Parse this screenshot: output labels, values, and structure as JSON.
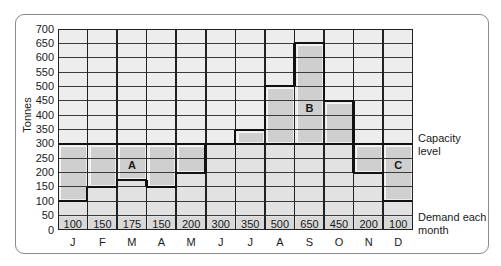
{
  "chart_data": {
    "type": "bar",
    "title": "",
    "xlabel": "",
    "ylabel": "Tonnes",
    "ylim": [
      0,
      700
    ],
    "ytick_step": 50,
    "yticks": [
      0,
      50,
      100,
      150,
      200,
      250,
      300,
      350,
      400,
      450,
      500,
      550,
      600,
      650,
      700
    ],
    "categories": [
      "J",
      "F",
      "M",
      "A",
      "M",
      "J",
      "J",
      "A",
      "S",
      "O",
      "N",
      "D"
    ],
    "series": [
      {
        "name": "Demand each month",
        "values": [
          100,
          150,
          175,
          150,
          200,
          300,
          350,
          500,
          650,
          450,
          200,
          100
        ]
      }
    ],
    "capacity_level": 300,
    "value_labels": [
      "100",
      "150",
      "175",
      "150",
      "200",
      "300",
      "350",
      "500",
      "650",
      "450",
      "200",
      "100"
    ],
    "annotations": [
      {
        "text": "A",
        "column": 2,
        "value": 225
      },
      {
        "text": "B",
        "column": 8,
        "value": 425
      },
      {
        "text": "C",
        "column": 11,
        "value": 225
      }
    ],
    "legend": {
      "capacity": "Capacity level",
      "demand": "Demand each month"
    },
    "grid": true
  },
  "labels": {
    "ylabel": "Tonnes",
    "capacity_line1": "Capacity",
    "capacity_line2": "level",
    "demand_line1": "Demand each",
    "demand_line2": "month"
  },
  "colors": {
    "cell_light": "#ededed",
    "bar_fill": "#e2e2e2",
    "gap_fill": "#cfcfcf",
    "label_row": "#d8d8d8",
    "grid": "#3a3a3a",
    "line": "#111111"
  }
}
